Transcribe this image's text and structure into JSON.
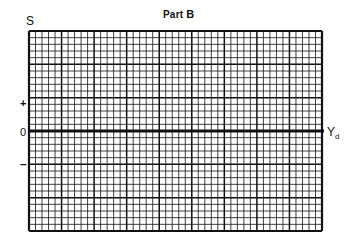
{
  "title": {
    "prefix": "Part ",
    "letter": "B"
  },
  "axes": {
    "y_label": "S",
    "x_label_main": "Y",
    "x_label_sub": "d",
    "plus": "+",
    "zero": "0",
    "minus": "–"
  },
  "grid": {
    "left": 29,
    "top": 31,
    "right": 322,
    "bottom": 231,
    "major_cols": 9,
    "major_rows": 6,
    "minor_per_major": 5,
    "zero_row_index": 3,
    "line_color": "#111111"
  }
}
